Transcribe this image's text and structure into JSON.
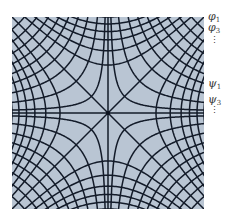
{
  "diagram": {
    "type": "orthogonal-flow-net",
    "colors": {
      "background": "#b9c5d3",
      "line": "#131b29",
      "center_dot": "#0d1320"
    },
    "phi_family": {
      "equation": "x^2 - y^2 = c",
      "levels": [
        0,
        0.25,
        0.42,
        0.58,
        0.72,
        0.86,
        1.0,
        1.16,
        1.34,
        1.54,
        1.76
      ]
    },
    "psi_family": {
      "equation": "2xy = c",
      "levels": [
        0,
        0.06,
        0.22,
        0.42,
        0.62,
        0.82,
        1.02,
        1.24,
        1.48,
        1.74
      ]
    }
  },
  "labels": {
    "phi_1": {
      "symbol": "φ",
      "sub": "1"
    },
    "phi_3": {
      "symbol": "φ",
      "sub": "3"
    },
    "phi_more": "⋮",
    "psi_1": {
      "symbol": "ψ",
      "sub": "1"
    },
    "psi_3": {
      "symbol": "ψ",
      "sub": "3"
    },
    "psi_more": "⋮"
  }
}
